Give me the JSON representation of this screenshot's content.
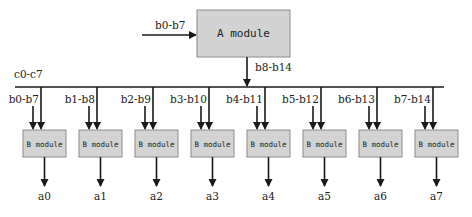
{
  "diagram": {
    "colors": {
      "module_fill": "#d3d3d3",
      "module_stroke": "#8a8a8a",
      "line": "#1a1a1a",
      "text": "#222222"
    },
    "a_module": {
      "label": "A module",
      "input_label": "b0-b7",
      "output_label": "b8-b14"
    },
    "bus": {
      "label": "c0-c7"
    },
    "b_modules": [
      {
        "label": "B module",
        "input_label": "b0-b7",
        "output": "a0"
      },
      {
        "label": "B module",
        "input_label": "b1-b8",
        "output": "a1"
      },
      {
        "label": "B module",
        "input_label": "b2-b9",
        "output": "a2"
      },
      {
        "label": "B module",
        "input_label": "b3-b10",
        "output": "a3"
      },
      {
        "label": "B module",
        "input_label": "b4-b11",
        "output": "a4"
      },
      {
        "label": "B module",
        "input_label": "b5-b12",
        "output": "a5"
      },
      {
        "label": "B module",
        "input_label": "b6-b13",
        "output": "a6"
      },
      {
        "label": "B module",
        "input_label": "b7-b14",
        "output": "a7"
      }
    ]
  }
}
